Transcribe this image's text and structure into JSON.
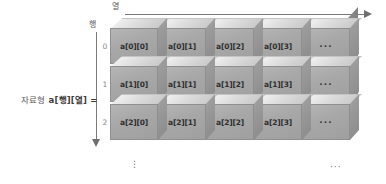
{
  "figure": {
    "caption": "자료형 a[행][열] =",
    "caption_prefix": "자료형",
    "caption_expr": "a[행][열] =",
    "column_axis_label": "열",
    "row_axis_label": "행",
    "column_indices": [
      "0",
      "1",
      "2",
      "3"
    ],
    "row_indices": [
      "0",
      "1",
      "2"
    ],
    "vertical_ellipsis": "⋮",
    "horizontal_ellipsis": "···",
    "colors": {
      "cell_face": "#a8a8a8",
      "cell_top": "#dcdcdc",
      "cell_side": "#8e8e8e",
      "axis": "#7a7a7a",
      "text": "#2e2e2e",
      "index_text": "#888888",
      "background": "#ffffff"
    }
  },
  "chart_data": {
    "type": "table",
    "title": "자료형 a[행][열] =",
    "xlabel": "열",
    "ylabel": "행",
    "columns": [
      "0",
      "1",
      "2",
      "3",
      "···"
    ],
    "rows": [
      "0",
      "1",
      "2"
    ],
    "cells": [
      [
        "a[0][0]",
        "a[0][1]",
        "a[0][2]",
        "a[0][3]",
        "···"
      ],
      [
        "a[1][0]",
        "a[1][1]",
        "a[1][2]",
        "a[1][3]",
        "···"
      ],
      [
        "a[2][0]",
        "a[2][1]",
        "a[2][2]",
        "a[2][3]",
        "···"
      ]
    ]
  }
}
